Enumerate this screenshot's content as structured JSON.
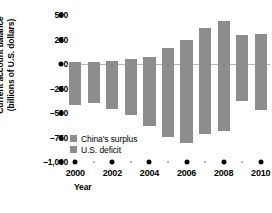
{
  "chart_data": {
    "type": "bar",
    "title": "",
    "subtitle": "",
    "xlabel": "Year",
    "ylabel": "Current account balance (billions of U.S. dollars)",
    "ylabel_lines": [
      "Current account balance",
      "(billions of U.S. dollars)"
    ],
    "categories": [
      "2000",
      "2001",
      "2002",
      "2003",
      "2004",
      "2005",
      "2006",
      "2007",
      "2008",
      "2009",
      "2010"
    ],
    "x": [
      2000,
      2001,
      2002,
      2003,
      2004,
      2005,
      2006,
      2007,
      2008,
      2009,
      2010
    ],
    "series": [
      {
        "name": "China's surplus",
        "color": "#8d8d8d",
        "values": [
          20,
          17,
          35,
          46,
          69,
          160,
          250,
          372,
          436,
          297,
          305
        ]
      },
      {
        "name": "U.S. deficit",
        "color": "#8d8d8d",
        "values": [
          -417,
          -399,
          -459,
          -521,
          -631,
          -749,
          -811,
          -719,
          -687,
          -381,
          -471
        ]
      }
    ],
    "ylim": [
      -1000,
      500
    ],
    "yticks": [
      500,
      250,
      0,
      -250,
      -500,
      -750,
      -1000
    ],
    "ytick_labels": [
      "500",
      "250",
      "0",
      "–250",
      "–500",
      "–750",
      "–1,000"
    ],
    "xticks": [
      2000,
      2002,
      2004,
      2006,
      2008,
      2010
    ],
    "xtick_labels": [
      "2000",
      "2002",
      "2004",
      "2006",
      "2008",
      "2010"
    ],
    "xticks_minor": [
      2001,
      2003,
      2005,
      2007,
      2009
    ],
    "grid": false,
    "zero_line": true,
    "legend_position": "inside-lower-left"
  },
  "legend": {
    "items": [
      {
        "label": "China's surplus",
        "color": "#8d8d8d"
      },
      {
        "label": "U.S. deficit",
        "color": "#8d8d8d"
      }
    ]
  },
  "colors": {
    "bar": "#8d8d8d",
    "zero_line": "#b9b9b9",
    "axis_dot": "#000000",
    "axis_dot_minor": "#9a9a9a",
    "background": "#ffffff",
    "text": "#000000"
  }
}
